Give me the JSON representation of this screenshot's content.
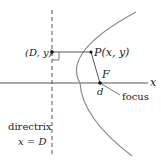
{
  "diagram": {
    "labels": {
      "point_on_directrix": "(D, y)",
      "point_p": "P(x, y)",
      "focus_letter": "F",
      "distance": "d",
      "focus": "focus",
      "directrix": "directrix",
      "directrix_eq": "x = D",
      "x_axis": "x"
    },
    "colors": {
      "curve": "#8a8a8a",
      "lines": "#555555",
      "text": "#222222"
    }
  }
}
